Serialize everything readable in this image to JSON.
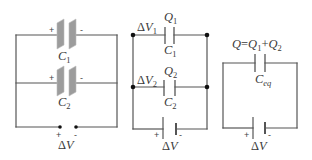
{
  "colors": {
    "background": "#ffffff",
    "wire": "#555555",
    "plate_fill": "#9c9c9c",
    "plate_edge": "#bdbdbd",
    "node": "#111111",
    "text": "#3a3a3a"
  },
  "left_circuit": {
    "capacitor_1": {
      "symbol": "C",
      "subscript": "1",
      "plus": "+",
      "minus": "-"
    },
    "capacitor_2": {
      "symbol": "C",
      "subscript": "2",
      "plus": "+",
      "minus": "-"
    },
    "source": {
      "delta": "Δ",
      "symbol": "V",
      "plus": "+",
      "minus": "-"
    }
  },
  "middle_circuit": {
    "branch_1": {
      "voltage": {
        "delta": "Δ",
        "symbol": "V",
        "subscript": "1"
      },
      "charge": {
        "symbol": "Q",
        "subscript": "1"
      },
      "capacitor": {
        "symbol": "C",
        "subscript": "1"
      }
    },
    "branch_2": {
      "voltage": {
        "delta": "Δ",
        "symbol": "V",
        "subscript": "2"
      },
      "charge": {
        "symbol": "Q",
        "subscript": "2"
      },
      "capacitor": {
        "symbol": "C",
        "subscript": "2"
      }
    },
    "battery": {
      "delta": "Δ",
      "symbol": "V",
      "plus": "+",
      "minus": "-"
    }
  },
  "right_circuit": {
    "charge_equation": {
      "total": "Q",
      "equals": "=",
      "term_1": "Q",
      "term_1_sub": "1",
      "plus": "+",
      "term_2": "Q",
      "term_2_sub": "2"
    },
    "capacitor": {
      "symbol": "C",
      "subscript": "eq"
    },
    "battery": {
      "delta": "Δ",
      "symbol": "V",
      "plus": "+",
      "minus": "-"
    }
  }
}
